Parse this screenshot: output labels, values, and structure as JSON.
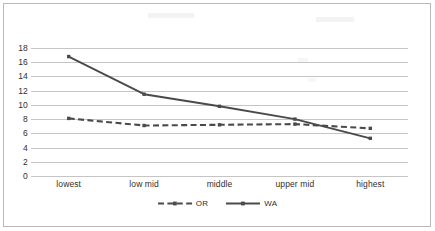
{
  "chart_data": {
    "type": "line",
    "title": "",
    "subtitle": "",
    "xlabel": "",
    "ylabel": "",
    "categories": [
      "lowest",
      "low mid",
      "middle",
      "upper mid",
      "highest"
    ],
    "series": [
      {
        "name": "OR",
        "style": "dashed",
        "marker": "square",
        "color": "#4a4a4a",
        "values": [
          8.1,
          7.1,
          7.2,
          7.3,
          6.7
        ]
      },
      {
        "name": "WA",
        "style": "solid",
        "marker": "square",
        "color": "#4a4a4a",
        "values": [
          16.8,
          11.5,
          9.8,
          8.0,
          5.3
        ]
      }
    ],
    "ylim": [
      0,
      18
    ],
    "ytick_values": [
      0,
      2,
      4,
      6,
      8,
      10,
      12,
      14,
      16,
      18
    ],
    "ytick_labels": [
      "0",
      "2",
      "4",
      "6",
      "8",
      "10",
      "12",
      "14",
      "16",
      "18"
    ],
    "grid": true,
    "grid_axis": "y",
    "grid_color": "#c5c5c5",
    "legend_position": "bottom",
    "legend_entries": [
      "OR",
      "WA"
    ],
    "plot_background": "#ffffff",
    "border_color": "#b9b9b9"
  },
  "legend": {
    "items": [
      {
        "label": "OR",
        "swatch_name": "legend-swatch-or"
      },
      {
        "label": "WA",
        "swatch_name": "legend-swatch-wa"
      }
    ]
  }
}
